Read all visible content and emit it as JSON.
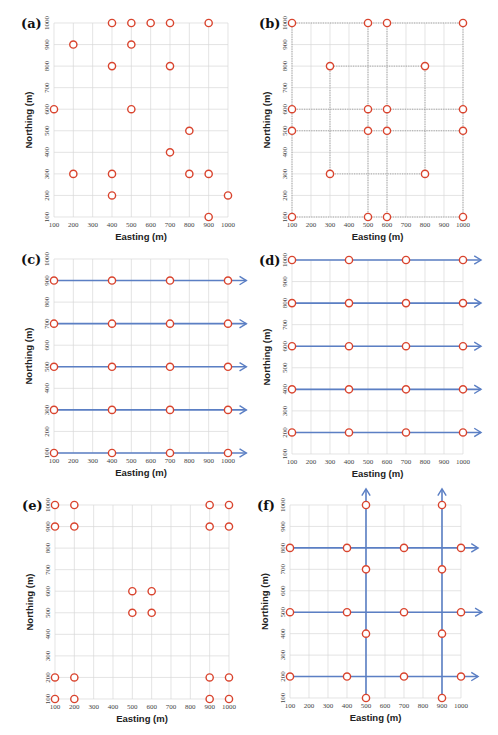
{
  "figure": {
    "colors": {
      "marker": "#d9442e",
      "route": "#5b7fc4",
      "grid": "#d9d9d9",
      "survey_frame": "#888888"
    },
    "x_label": "Easting (m)",
    "y_label": "Northing (m)",
    "x_ticks": [
      100,
      200,
      300,
      400,
      500,
      600,
      700,
      800,
      900,
      1000
    ],
    "y_ticks": [
      100,
      200,
      300,
      400,
      500,
      600,
      700,
      800,
      900,
      1000
    ]
  },
  "chart_data": [
    {
      "type": "scatter",
      "panel": "(a)",
      "title": "(a)",
      "xlabel": "Easting (m)",
      "ylabel": "Northing (m)",
      "xlim": [
        100,
        1000
      ],
      "ylim": [
        100,
        1000
      ],
      "grid": true,
      "box": {
        "x0": 54,
        "x1": 228,
        "y_top": 23,
        "y_bot": 217
      },
      "points": [
        [
          400,
          1000
        ],
        [
          500,
          1000
        ],
        [
          600,
          1000
        ],
        [
          700,
          1000
        ],
        [
          900,
          1000
        ],
        [
          200,
          900
        ],
        [
          500,
          900
        ],
        [
          400,
          800
        ],
        [
          700,
          800
        ],
        [
          100,
          600
        ],
        [
          500,
          600
        ],
        [
          800,
          500
        ],
        [
          700,
          400
        ],
        [
          200,
          300
        ],
        [
          400,
          300
        ],
        [
          800,
          300
        ],
        [
          900,
          300
        ],
        [
          400,
          200
        ],
        [
          1000,
          200
        ],
        [
          900,
          100
        ]
      ],
      "routes": [],
      "frames": []
    },
    {
      "type": "scatter",
      "panel": "(b)",
      "title": "(b)",
      "xlabel": "Easting (m)",
      "ylabel": "Northing (m)",
      "xlim": [
        100,
        1000
      ],
      "ylim": [
        100,
        1000
      ],
      "grid": true,
      "box": {
        "x0": 292,
        "x1": 463,
        "y_top": 23,
        "y_bot": 217
      },
      "points": [
        [
          100,
          1000
        ],
        [
          500,
          1000
        ],
        [
          600,
          1000
        ],
        [
          1000,
          1000
        ],
        [
          300,
          800
        ],
        [
          800,
          800
        ],
        [
          100,
          600
        ],
        [
          500,
          600
        ],
        [
          600,
          600
        ],
        [
          1000,
          600
        ],
        [
          100,
          500
        ],
        [
          500,
          500
        ],
        [
          600,
          500
        ],
        [
          1000,
          500
        ],
        [
          300,
          300
        ],
        [
          800,
          300
        ],
        [
          100,
          100
        ],
        [
          500,
          100
        ],
        [
          600,
          100
        ],
        [
          1000,
          100
        ]
      ],
      "routes": [],
      "frames": [
        [
          [
            100,
            100
          ],
          [
            1000,
            100
          ],
          [
            1000,
            1000
          ],
          [
            100,
            1000
          ],
          [
            100,
            100
          ]
        ],
        [
          [
            300,
            300
          ],
          [
            800,
            300
          ],
          [
            800,
            800
          ],
          [
            300,
            800
          ],
          [
            300,
            300
          ]
        ],
        [
          [
            500,
            100
          ],
          [
            500,
            1000
          ]
        ],
        [
          [
            600,
            100
          ],
          [
            600,
            1000
          ]
        ],
        [
          [
            100,
            500
          ],
          [
            1000,
            500
          ]
        ],
        [
          [
            100,
            600
          ],
          [
            1000,
            600
          ]
        ]
      ]
    },
    {
      "type": "scatter",
      "panel": "(c)",
      "title": "(c)",
      "xlabel": "Easting (m)",
      "ylabel": "Northing (m)",
      "xlim": [
        100,
        1000
      ],
      "ylim": [
        100,
        1000
      ],
      "grid": true,
      "box": {
        "x0": 54,
        "x1": 228,
        "y_top": 259,
        "y_bot": 453
      },
      "points": [
        [
          100,
          900
        ],
        [
          400,
          900
        ],
        [
          700,
          900
        ],
        [
          1000,
          900
        ],
        [
          100,
          700
        ],
        [
          400,
          700
        ],
        [
          700,
          700
        ],
        [
          1000,
          700
        ],
        [
          100,
          500
        ],
        [
          400,
          500
        ],
        [
          700,
          500
        ],
        [
          1000,
          500
        ],
        [
          100,
          300
        ],
        [
          400,
          300
        ],
        [
          700,
          300
        ],
        [
          1000,
          300
        ],
        [
          100,
          100
        ],
        [
          400,
          100
        ],
        [
          700,
          100
        ],
        [
          1000,
          100
        ]
      ],
      "routes": [
        {
          "from": [
            100,
            900
          ],
          "to": [
            1095,
            900
          ]
        },
        {
          "from": [
            100,
            700
          ],
          "to": [
            1095,
            700
          ]
        },
        {
          "from": [
            100,
            500
          ],
          "to": [
            1095,
            500
          ]
        },
        {
          "from": [
            100,
            300
          ],
          "to": [
            1095,
            300
          ]
        },
        {
          "from": [
            100,
            100
          ],
          "to": [
            1095,
            100
          ]
        }
      ],
      "frames": []
    },
    {
      "type": "scatter",
      "panel": "(d)",
      "title": "(d)",
      "xlabel": "Easting (m)",
      "ylabel": "Northing (m)",
      "xlim": [
        100,
        1000
      ],
      "ylim": [
        100,
        1000
      ],
      "grid": true,
      "box": {
        "x0": 292,
        "x1": 463,
        "y_top": 260,
        "y_bot": 454
      },
      "points": [
        [
          100,
          1000
        ],
        [
          400,
          1000
        ],
        [
          700,
          1000
        ],
        [
          1000,
          1000
        ],
        [
          100,
          800
        ],
        [
          400,
          800
        ],
        [
          700,
          800
        ],
        [
          1000,
          800
        ],
        [
          100,
          600
        ],
        [
          400,
          600
        ],
        [
          700,
          600
        ],
        [
          1000,
          600
        ],
        [
          100,
          400
        ],
        [
          400,
          400
        ],
        [
          700,
          400
        ],
        [
          1000,
          400
        ],
        [
          100,
          200
        ],
        [
          400,
          200
        ],
        [
          700,
          200
        ],
        [
          1000,
          200
        ]
      ],
      "routes": [
        {
          "from": [
            100,
            1000
          ],
          "to": [
            1095,
            1000
          ]
        },
        {
          "from": [
            100,
            800
          ],
          "to": [
            1095,
            800
          ]
        },
        {
          "from": [
            100,
            600
          ],
          "to": [
            1095,
            600
          ]
        },
        {
          "from": [
            100,
            400
          ],
          "to": [
            1095,
            400
          ]
        },
        {
          "from": [
            100,
            200
          ],
          "to": [
            1095,
            200
          ]
        }
      ],
      "frames": []
    },
    {
      "type": "scatter",
      "panel": "(e)",
      "title": "(e)",
      "xlabel": "Easting (m)",
      "ylabel": "Northing (m)",
      "xlim": [
        100,
        1000
      ],
      "ylim": [
        100,
        1000
      ],
      "grid": true,
      "box": {
        "x0": 55,
        "x1": 229,
        "y_top": 505,
        "y_bot": 699
      },
      "points": [
        [
          100,
          1000
        ],
        [
          200,
          1000
        ],
        [
          900,
          1000
        ],
        [
          1000,
          1000
        ],
        [
          100,
          900
        ],
        [
          200,
          900
        ],
        [
          900,
          900
        ],
        [
          1000,
          900
        ],
        [
          500,
          600
        ],
        [
          600,
          600
        ],
        [
          500,
          500
        ],
        [
          600,
          500
        ],
        [
          100,
          200
        ],
        [
          200,
          200
        ],
        [
          900,
          200
        ],
        [
          1000,
          200
        ],
        [
          100,
          100
        ],
        [
          200,
          100
        ],
        [
          900,
          100
        ],
        [
          1000,
          100
        ]
      ],
      "routes": [],
      "frames": []
    },
    {
      "type": "scatter",
      "panel": "(f)",
      "title": "(f)",
      "xlabel": "Easting (m)",
      "ylabel": "Northing (m)",
      "xlim": [
        100,
        1000
      ],
      "ylim": [
        100,
        1000
      ],
      "grid": true,
      "box": {
        "x0": 290,
        "x1": 461,
        "y_top": 505,
        "y_bot": 698
      },
      "points": [
        [
          500,
          1000
        ],
        [
          900,
          1000
        ],
        [
          100,
          800
        ],
        [
          400,
          800
        ],
        [
          700,
          800
        ],
        [
          1000,
          800
        ],
        [
          500,
          700
        ],
        [
          900,
          700
        ],
        [
          100,
          500
        ],
        [
          400,
          500
        ],
        [
          700,
          500
        ],
        [
          1000,
          500
        ],
        [
          500,
          400
        ],
        [
          900,
          400
        ],
        [
          100,
          200
        ],
        [
          400,
          200
        ],
        [
          700,
          200
        ],
        [
          1000,
          200
        ],
        [
          500,
          100
        ],
        [
          900,
          100
        ]
      ],
      "routes": [
        {
          "from": [
            100,
            800
          ],
          "to": [
            1090,
            800
          ]
        },
        {
          "from": [
            100,
            500
          ],
          "to": [
            1110,
            500
          ]
        },
        {
          "from": [
            100,
            200
          ],
          "to": [
            1090,
            200
          ]
        },
        {
          "from": [
            500,
            100
          ],
          "to": [
            500,
            1075
          ]
        },
        {
          "from": [
            900,
            100
          ],
          "to": [
            900,
            1075
          ]
        }
      ],
      "frames": []
    }
  ]
}
